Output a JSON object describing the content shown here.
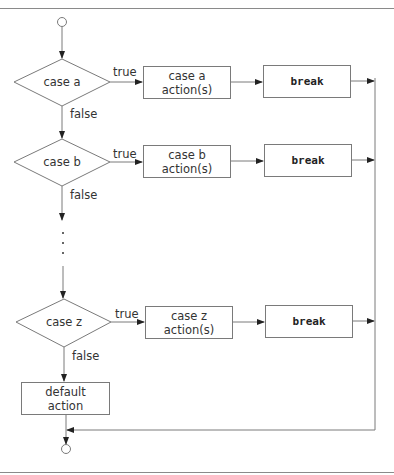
{
  "diagram": {
    "type": "flowchart",
    "cases": [
      {
        "condition": "case a",
        "true_label": "true",
        "false_label": "false",
        "action": "case a\naction(s)",
        "break": "break"
      },
      {
        "condition": "case b",
        "true_label": "true",
        "false_label": "false",
        "action": "case b\naction(s)",
        "break": "break"
      },
      {
        "condition": "case z",
        "true_label": "true",
        "false_label": "false",
        "action": "case z\naction(s)",
        "break": "break"
      }
    ],
    "ellipsis": "⋮",
    "default_action": "default\naction",
    "colors": {
      "line": "#7a7a7a",
      "text": "#333333",
      "rule": "#8a8a8a"
    }
  }
}
